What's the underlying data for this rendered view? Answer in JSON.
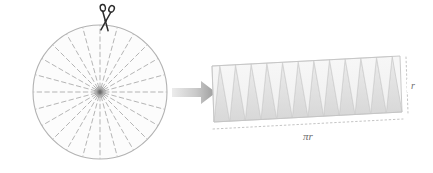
{
  "figure": {
    "background_color": "#ffffff"
  },
  "circle": {
    "name": "circle-with-sectors",
    "center_x": 100,
    "center_y": 92,
    "radius": 67,
    "sector_count": 24,
    "outline_color": "#b0b0b0",
    "fill_color": "#fbfbfb",
    "dash_color": "#a9a9a9",
    "hub_color": "#8c8c8c",
    "hub_radius": 4
  },
  "scissors": {
    "name": "scissors-icon",
    "x": 107,
    "y": 22,
    "color": "#2b2b2b",
    "glyph": "scissors"
  },
  "arrow": {
    "name": "transform-arrow-icon",
    "x": 172,
    "y": 86,
    "width": 45,
    "height": 18,
    "color_start": "#e8e8e8",
    "color_end": "#9a9a9a"
  },
  "parallelogram": {
    "name": "unrolled-sectors-parallelogram",
    "left": 212,
    "top": 56,
    "width": 190,
    "height": 66,
    "slant": 10,
    "triangle_count_up": 12,
    "triangle_count_down": 12,
    "fill_light": "#f4f4f4",
    "fill_dark": "#e0e0e0",
    "edge_color": "#c2c2c2",
    "dotted_color": "#bdbdbd"
  },
  "labels": {
    "base": {
      "text": "πr",
      "name": "base-length-label",
      "x": 308,
      "y": 142
    },
    "height": {
      "text": "r",
      "name": "height-label",
      "x": 412,
      "y": 95
    }
  },
  "colors": {
    "accent_dark": "#2b2b2b",
    "line_gray": "#b0b0b0",
    "fill_gray": "#ededed"
  }
}
